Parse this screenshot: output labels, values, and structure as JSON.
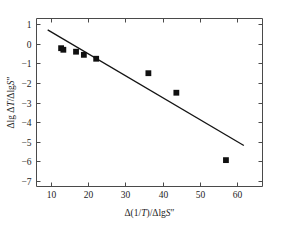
{
  "chart_data": {
    "type": "scatter",
    "title": "",
    "subtitle": "",
    "xlabel": "Δ(1/T)/ΔlgS″",
    "ylabel": "Δlg ΔT/ΔlgS″",
    "xlabel_parts": {
      "delta1": "Δ(1/",
      "var_t": "T",
      "mid": ")/Δlg",
      "var_s": "S",
      "prime": "″"
    },
    "ylabel_parts": {
      "lead": "Δlg Δ",
      "var_t": "T",
      "mid": "/Δlg",
      "var_s": "S",
      "prime": "″"
    },
    "xlim": [
      6.2,
      66.8
    ],
    "ylim": [
      -7.3,
      1.3
    ],
    "xticks": [
      10,
      20,
      30,
      40,
      50,
      60
    ],
    "xtick_labels": [
      "10",
      "20",
      "30",
      "40",
      "50",
      "60"
    ],
    "yticks": [
      1,
      0,
      -1,
      -2,
      -3,
      -4,
      -5,
      -6,
      -7
    ],
    "ytick_labels": [
      "1",
      "0",
      "−1",
      "−2",
      "−3",
      "−4",
      "−5",
      "−6",
      "−7"
    ],
    "grid": false,
    "legend": null,
    "marker": "square",
    "marker_color": "#101010",
    "line_color": "#141414",
    "axis_color": "#4a4a4a",
    "background": "#ffffff",
    "points": [
      {
        "x": 12.8,
        "y": -0.22
      },
      {
        "x": 13.4,
        "y": -0.3
      },
      {
        "x": 16.8,
        "y": -0.4
      },
      {
        "x": 18.9,
        "y": -0.56
      },
      {
        "x": 22.2,
        "y": -0.76
      },
      {
        "x": 36.2,
        "y": -1.5
      },
      {
        "x": 43.7,
        "y": -2.5
      },
      {
        "x": 57.0,
        "y": -5.95
      }
    ],
    "series": [
      {
        "name": "data",
        "x": [
          12.8,
          13.4,
          16.8,
          18.9,
          22.2,
          36.2,
          43.7,
          57.0
        ],
        "values": [
          -0.22,
          -0.3,
          -0.4,
          -0.56,
          -0.76,
          -1.5,
          -2.5,
          -5.95
        ]
      }
    ],
    "fit_line": {
      "name": "linear fit",
      "x_start": 9.2,
      "y_start": 0.72,
      "x_end": 61.8,
      "y_end": -5.2,
      "slope": -0.1125,
      "intercept": 1.755
    }
  }
}
